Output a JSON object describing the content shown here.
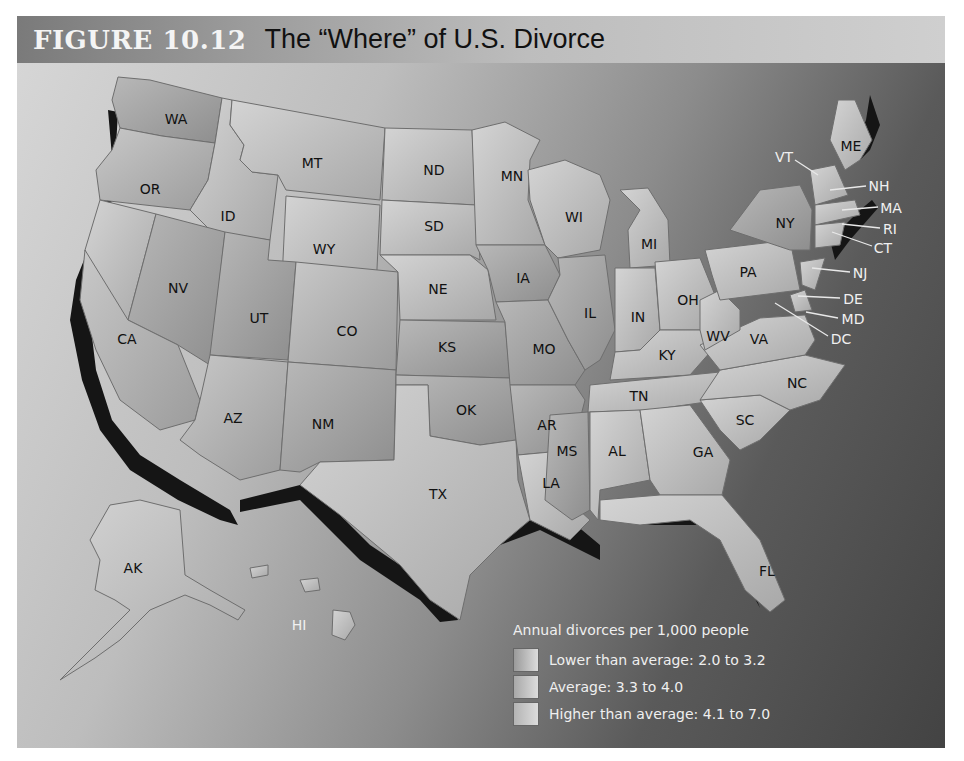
{
  "figure": {
    "number": "FIGURE 10.12",
    "title": "The “Where” of U.S. Divorce"
  },
  "legend": {
    "title": "Annual divorces per 1,000 people",
    "items": [
      {
        "label": "Lower than average: 2.0 to 3.2",
        "color": "#9a9a9a"
      },
      {
        "label": "Average: 3.3  to 4.0",
        "color": "#a8a8a8"
      },
      {
        "label": "Higher than average: 4.1 to 7.0",
        "color": "#b4b4b4"
      }
    ]
  },
  "map": {
    "states": [
      {
        "abbr": "WA",
        "x": 176,
        "y": 119
      },
      {
        "abbr": "OR",
        "x": 150,
        "y": 189
      },
      {
        "abbr": "ID",
        "x": 228,
        "y": 216
      },
      {
        "abbr": "MT",
        "x": 312,
        "y": 163
      },
      {
        "abbr": "WY",
        "x": 324,
        "y": 249
      },
      {
        "abbr": "NV",
        "x": 178,
        "y": 288
      },
      {
        "abbr": "UT",
        "x": 259,
        "y": 318
      },
      {
        "abbr": "CA",
        "x": 127,
        "y": 339
      },
      {
        "abbr": "CO",
        "x": 347,
        "y": 331
      },
      {
        "abbr": "AZ",
        "x": 233,
        "y": 418
      },
      {
        "abbr": "NM",
        "x": 323,
        "y": 424
      },
      {
        "abbr": "ND",
        "x": 434,
        "y": 170
      },
      {
        "abbr": "SD",
        "x": 434,
        "y": 226
      },
      {
        "abbr": "NE",
        "x": 438,
        "y": 289
      },
      {
        "abbr": "KS",
        "x": 447,
        "y": 347
      },
      {
        "abbr": "OK",
        "x": 466,
        "y": 410
      },
      {
        "abbr": "TX",
        "x": 438,
        "y": 494
      },
      {
        "abbr": "MN",
        "x": 512,
        "y": 176
      },
      {
        "abbr": "IA",
        "x": 523,
        "y": 278
      },
      {
        "abbr": "MO",
        "x": 544,
        "y": 349
      },
      {
        "abbr": "AR",
        "x": 547,
        "y": 425
      },
      {
        "abbr": "LA",
        "x": 551,
        "y": 483
      },
      {
        "abbr": "WI",
        "x": 574,
        "y": 217
      },
      {
        "abbr": "IL",
        "x": 590,
        "y": 313
      },
      {
        "abbr": "MI",
        "x": 649,
        "y": 244
      },
      {
        "abbr": "IN",
        "x": 638,
        "y": 317
      },
      {
        "abbr": "OH",
        "x": 688,
        "y": 300
      },
      {
        "abbr": "KY",
        "x": 667,
        "y": 355
      },
      {
        "abbr": "TN",
        "x": 639,
        "y": 396
      },
      {
        "abbr": "MS",
        "x": 567,
        "y": 451
      },
      {
        "abbr": "AL",
        "x": 617,
        "y": 451
      },
      {
        "abbr": "GA",
        "x": 703,
        "y": 452
      },
      {
        "abbr": "FL",
        "x": 767,
        "y": 571
      },
      {
        "abbr": "SC",
        "x": 745,
        "y": 420
      },
      {
        "abbr": "NC",
        "x": 797,
        "y": 383
      },
      {
        "abbr": "VA",
        "x": 759,
        "y": 339
      },
      {
        "abbr": "WV",
        "x": 718,
        "y": 336
      },
      {
        "abbr": "PA",
        "x": 748,
        "y": 272
      },
      {
        "abbr": "NY",
        "x": 785,
        "y": 223
      },
      {
        "abbr": "ME",
        "x": 851,
        "y": 146
      },
      {
        "abbr": "AK",
        "x": 133,
        "y": 568
      },
      {
        "abbr": "HI",
        "x": 299,
        "y": 625,
        "light": true
      }
    ],
    "callouts": [
      {
        "abbr": "VT",
        "x": 784,
        "y": 157
      },
      {
        "abbr": "NH",
        "x": 879,
        "y": 186
      },
      {
        "abbr": "MA",
        "x": 891,
        "y": 208
      },
      {
        "abbr": "RI",
        "x": 890,
        "y": 229
      },
      {
        "abbr": "CT",
        "x": 883,
        "y": 248
      },
      {
        "abbr": "NJ",
        "x": 860,
        "y": 273
      },
      {
        "abbr": "DE",
        "x": 853,
        "y": 299
      },
      {
        "abbr": "MD",
        "x": 853,
        "y": 319
      },
      {
        "abbr": "DC",
        "x": 841,
        "y": 339
      }
    ]
  }
}
